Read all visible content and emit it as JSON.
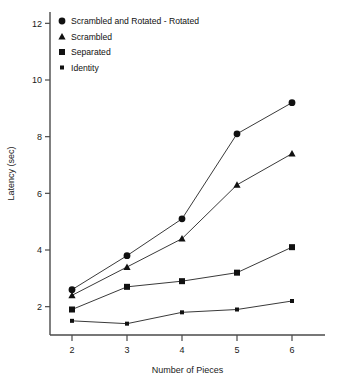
{
  "chart_data": {
    "type": "line",
    "title": "",
    "xlabel": "Number of Pieces",
    "ylabel": "Latency (sec)",
    "x": [
      2,
      3,
      4,
      5,
      6
    ],
    "xlim": [
      1.6,
      6.6
    ],
    "ylim": [
      1.0,
      12.4
    ],
    "xticks": [
      "2",
      "3",
      "4",
      "5",
      "6"
    ],
    "yticks": [
      "2",
      "4",
      "6",
      "8",
      "10",
      "12"
    ],
    "grid": false,
    "legend_position": "top-left",
    "series": [
      {
        "name": "Scrambled and Rotated - Rotated",
        "marker": "circle",
        "values": [
          2.6,
          3.8,
          5.1,
          8.1,
          9.2
        ]
      },
      {
        "name": "Scrambled",
        "marker": "triangle",
        "values": [
          2.4,
          3.4,
          4.4,
          6.3,
          7.4
        ]
      },
      {
        "name": "Separated",
        "marker": "square",
        "values": [
          1.9,
          2.7,
          2.9,
          3.2,
          4.1
        ]
      },
      {
        "name": "Identity",
        "marker": "star",
        "values": [
          1.5,
          1.4,
          1.8,
          1.9,
          2.2
        ]
      }
    ]
  },
  "axes": {
    "x_title": "Number of Pieces",
    "y_title": "Latency (sec)",
    "x_tick_labels": [
      "2",
      "3",
      "4",
      "5",
      "6"
    ],
    "y_tick_labels": [
      "2",
      "4",
      "6",
      "8",
      "10",
      "12"
    ]
  },
  "legend": {
    "items": [
      {
        "label": "Scrambled and Rotated - Rotated",
        "marker": "circle"
      },
      {
        "label": "Scrambled",
        "marker": "triangle"
      },
      {
        "label": "Separated",
        "marker": "square"
      },
      {
        "label": "Identity",
        "marker": "star"
      }
    ]
  },
  "colors": {
    "ink": "#111111",
    "axis": "#4a4a4a",
    "background": "#ffffff"
  }
}
